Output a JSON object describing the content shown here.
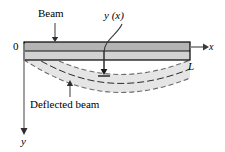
{
  "figure": {
    "labels": {
      "beam": "Beam",
      "deflection_function": "y (x)",
      "origin": "0",
      "x_axis": "x",
      "y_axis": "y",
      "length": "L",
      "deflected_beam": "Deflected beam"
    },
    "colors": {
      "outline": "#000000",
      "beam_fill_top": "#b3b3b3",
      "beam_fill_bottom": "#d0d0d0",
      "deflected_fill": "#e2e2e2",
      "dashed_stroke": "#6e6e6e",
      "axis": "#7d7d7d"
    },
    "geometry": {
      "beam_left": 24,
      "beam_right": 190,
      "beam_top": 42,
      "beam_bottom": 60,
      "beam_midline": 51,
      "deflection_max": 34
    }
  }
}
